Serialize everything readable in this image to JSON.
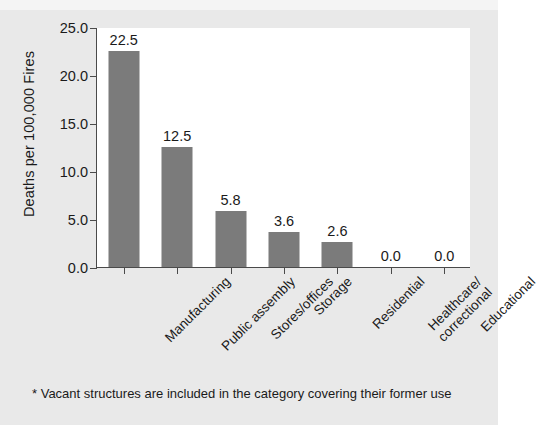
{
  "chart_data": {
    "type": "bar",
    "title": "",
    "xlabel": "",
    "ylabel": "Deaths per 100,000 Fires",
    "categories": [
      "Manufacturing",
      "Public assembly",
      "Stores/offices",
      "Storage",
      "Residential",
      "Healthcare/\ncorrectional",
      "Educational"
    ],
    "category_lines": [
      [
        "Manufacturing"
      ],
      [
        "Public assembly"
      ],
      [
        "Stores/offices"
      ],
      [
        "Storage"
      ],
      [
        "Residential"
      ],
      [
        "Healthcare/",
        "correctional"
      ],
      [
        "Educational"
      ]
    ],
    "values": [
      22.5,
      12.5,
      5.8,
      3.6,
      2.6,
      0.0,
      0.0
    ],
    "value_labels": [
      "22.5",
      "12.5",
      "5.8",
      "3.6",
      "2.6",
      "0.0",
      "0.0"
    ],
    "ylim": [
      0.0,
      25.0
    ],
    "yticks": [
      0.0,
      5.0,
      10.0,
      15.0,
      20.0,
      25.0
    ],
    "ytick_labels": [
      "0.0",
      "5.0",
      "10.0",
      "15.0",
      "20.0",
      "25.0"
    ],
    "grid": false,
    "legend": null,
    "bar_color": "#7b7b7b",
    "axis_color": "#4a4a4a",
    "plot_background": "#ffffff",
    "figure_background": "#e9e9e9"
  },
  "footnote": {
    "text": "* Vacant structures are included in the category covering their former use"
  }
}
